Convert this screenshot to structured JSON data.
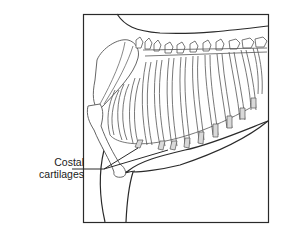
{
  "figure": {
    "labels": [
      {
        "id": "costal-cartilages",
        "line1": "Costal",
        "line2": "cartilages"
      }
    ]
  },
  "colors": {
    "stroke": "#2a2a2a",
    "bone_stroke": "#555555",
    "cartilage_fill": "#d9d9d9",
    "background": "#ffffff"
  }
}
